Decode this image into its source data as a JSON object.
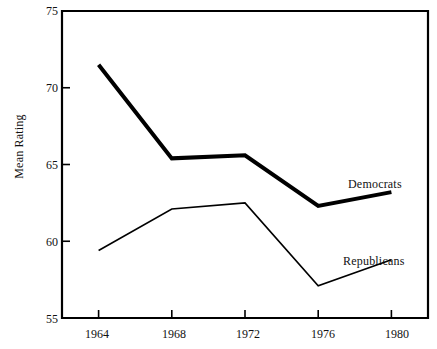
{
  "chart_data": {
    "type": "line",
    "title": "",
    "subtitle": "",
    "xlabel": "",
    "ylabel": "Mean Rating",
    "categories": [
      "1964",
      "1968",
      "1972",
      "1976",
      "1980"
    ],
    "x": [
      1964,
      1968,
      1972,
      1976,
      1980
    ],
    "xlim": [
      1962,
      1982
    ],
    "ylim": [
      55,
      75
    ],
    "yticks": [
      "75",
      "70",
      "65",
      "60",
      "55"
    ],
    "ytick_values": [
      75,
      70,
      65,
      60,
      55
    ],
    "xticks": [
      "1964",
      "1968",
      "1972",
      "1976",
      "1980"
    ],
    "grid": false,
    "legend_position": "inline-right",
    "series": [
      {
        "name": "Democrats",
        "values": [
          71.5,
          65.4,
          65.6,
          62.3,
          63.2
        ],
        "line_width": 4,
        "color": "#000000",
        "label": "Democrats"
      },
      {
        "name": "Republicans",
        "values": [
          59.4,
          62.1,
          62.5,
          57.1,
          58.8
        ],
        "line_width": 1.6,
        "color": "#000000",
        "label": "Republicans"
      }
    ],
    "annotations": [
      {
        "text": "Democrats",
        "x": 1977.6,
        "y": 64.4
      },
      {
        "text": "Republicans",
        "x": 1977.2,
        "y": 60.0
      }
    ]
  },
  "axis": {
    "y_title": "Mean Rating",
    "tick_top": "75",
    "tick_2": "70",
    "tick_3": "65",
    "tick_4": "60",
    "tick_bottom": "55",
    "x1": "1964",
    "x2": "1968",
    "x3": "1972",
    "x4": "1976",
    "x5": "1980"
  },
  "legend": {
    "democrats": "Democrats",
    "republicans": "Republicans"
  },
  "colors": {
    "ink": "#000000",
    "background": "#ffffff",
    "axis": "#111111"
  }
}
